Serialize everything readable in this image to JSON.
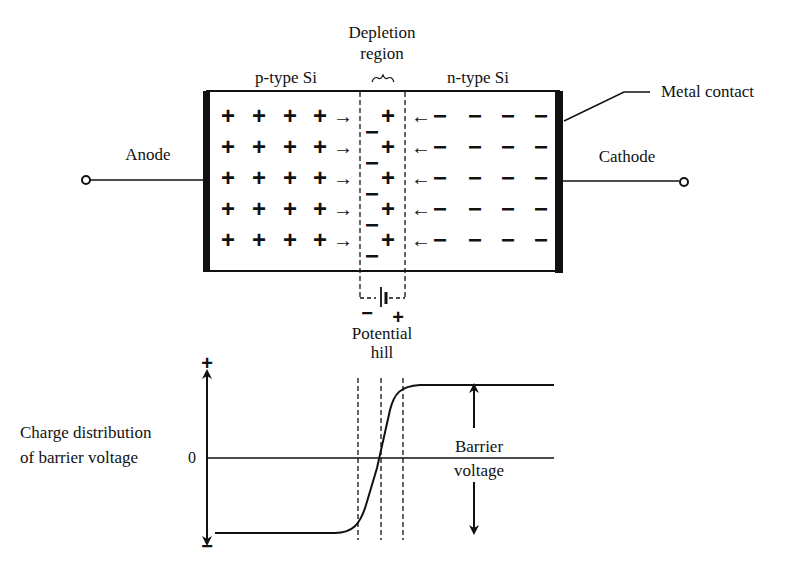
{
  "top_diagram": {
    "labels": {
      "depletion_line1": "Depletion",
      "depletion_line2": "region",
      "brace": "⏞",
      "p_type": "p-type Si",
      "n_type": "n-type Si",
      "metal_contact": "Metal contact",
      "anode": "Anode",
      "cathode": "Cathode",
      "potential_line1": "Potential",
      "potential_line2": "hill",
      "battery_minus": "−",
      "battery_plus": "+"
    },
    "rows": 5,
    "p_side_charges_per_row": [
      "+",
      "+",
      "+",
      "+"
    ],
    "n_side_charges_per_row": [
      "−",
      "−",
      "−",
      "−"
    ],
    "depletion_p_side_charge": "−",
    "depletion_n_side_charge": "+",
    "p_side_arrow": "→",
    "n_side_arrow": "←"
  },
  "bottom_graph": {
    "ylabel_line1": "Charge distribution",
    "ylabel_line2": "of barrier voltage",
    "axis_plus": "+",
    "axis_minus": "−",
    "zero_label": "0",
    "barrier_line1": "Barrier",
    "barrier_line2": "voltage"
  },
  "colors": {
    "ink": "#111111",
    "background": "#ffffff"
  }
}
